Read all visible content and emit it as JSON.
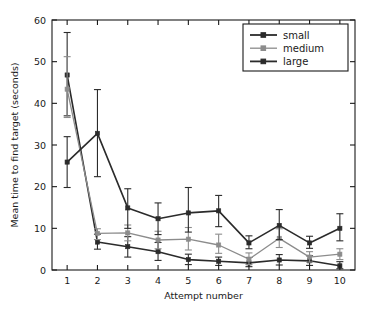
{
  "chart_data": {
    "type": "line",
    "title": "",
    "xlabel": "Attempt number",
    "ylabel": "Mean time to find target (seconds)",
    "x": [
      1,
      2,
      3,
      4,
      5,
      6,
      7,
      8,
      9,
      10
    ],
    "xtick_labels": [
      "1",
      "2",
      "3",
      "4",
      "5",
      "6",
      "7",
      "8",
      "9",
      "10"
    ],
    "ytick_labels": [
      "0",
      "10",
      "20",
      "30",
      "40",
      "50",
      "60"
    ],
    "yticks": [
      0,
      10,
      20,
      30,
      40,
      50,
      60
    ],
    "xlim": [
      0.5,
      10.5
    ],
    "ylim": [
      0,
      60
    ],
    "grid": false,
    "legend_position": "top-right",
    "error_bars": "symmetric vertical",
    "series": [
      {
        "name": "small",
        "color": "#2b2b2b",
        "marker": "square",
        "values": [
          46.8,
          6.7,
          5.6,
          4.4,
          2.5,
          2.1,
          1.7,
          2.4,
          2.2,
          1.0
        ],
        "err_low": [
          37.0,
          5.0,
          3.1,
          2.3,
          1.3,
          1.1,
          0.8,
          1.2,
          1.1,
          0.3
        ],
        "err_high": [
          57.0,
          8.6,
          8.0,
          6.6,
          3.8,
          3.1,
          3.0,
          3.7,
          3.4,
          2.0
        ]
      },
      {
        "name": "medium",
        "color": "#8c8c8c",
        "marker": "square",
        "values": [
          43.4,
          8.8,
          8.9,
          7.2,
          7.4,
          6.0,
          2.6,
          7.6,
          3.1,
          3.8
        ],
        "err_low": [
          36.6,
          7.3,
          7.0,
          5.1,
          4.8,
          4.0,
          1.3,
          5.4,
          1.9,
          2.5
        ],
        "err_high": [
          51.2,
          9.9,
          10.8,
          9.3,
          10.2,
          8.6,
          4.1,
          9.9,
          4.4,
          5.1
        ]
      },
      {
        "name": "large",
        "color": "#2b2b2b",
        "marker": "square",
        "values": [
          25.9,
          32.8,
          14.9,
          12.3,
          13.7,
          14.2,
          6.5,
          10.7,
          6.5,
          10.0
        ],
        "err_low": [
          19.8,
          22.4,
          10.0,
          8.5,
          9.1,
          10.4,
          5.1,
          7.3,
          5.2,
          7.0
        ],
        "err_high": [
          32.0,
          43.3,
          19.5,
          16.1,
          19.8,
          17.9,
          8.2,
          14.5,
          8.1,
          13.5
        ]
      }
    ]
  },
  "legend": {
    "items": [
      {
        "label": "small"
      },
      {
        "label": "medium"
      },
      {
        "label": "large"
      }
    ]
  },
  "axes": {
    "x_title": "Attempt number",
    "y_title": "Mean time to find target (seconds)"
  }
}
